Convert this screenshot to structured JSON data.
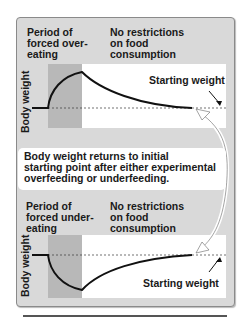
{
  "top_panel": {
    "period_label": [
      "Period of",
      "forced over-",
      "eating"
    ],
    "no_restrictions_label": [
      "No restrictions",
      "on food",
      "consumption"
    ],
    "y_axis_label": "Body weight",
    "starting_weight_label": "Starting weight"
  },
  "callout": {
    "lines": [
      "Body weight returns to initial",
      "starting point after either experimental",
      "overfeeding or underfeeding."
    ]
  },
  "bottom_panel": {
    "period_label": [
      "Period of",
      "forced under-",
      "eating"
    ],
    "no_restrictions_label": [
      "No restrictions",
      "on food",
      "consumption"
    ],
    "y_axis_label": "Body weight",
    "starting_weight_label": "Starting weight"
  },
  "colors": {
    "panel_bg": "#d9d9d9",
    "shaded_period": "#b8b8b8",
    "plot_bg": "#ffffff",
    "curve": "#111111"
  }
}
